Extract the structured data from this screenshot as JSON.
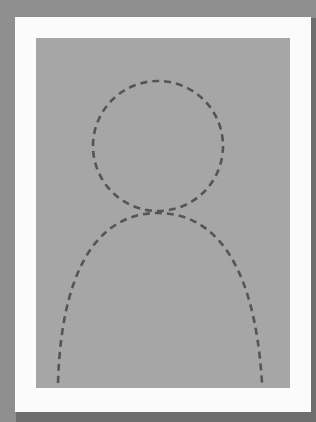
{
  "placeholder": {
    "type": "avatar-silhouette",
    "icon": "person-placeholder-icon",
    "colors": {
      "background": "#8f8f8f",
      "frame": "#fbfbfb",
      "photo_area": "#a6a6a6",
      "dash_stroke": "#555555"
    }
  }
}
